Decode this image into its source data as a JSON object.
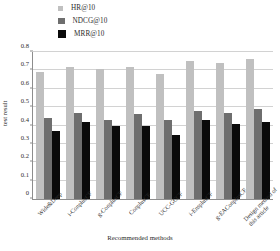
{
  "chart_data": {
    "type": "bar",
    "title": "",
    "xlabel": "Recommended methods",
    "ylabel": "test result",
    "ylim": [
      0,
      0.8
    ],
    "yticks": [
      "0",
      "0.1",
      "0.2",
      "0.3",
      "0.4",
      "0.5",
      "0.6",
      "0.7",
      "0.8"
    ],
    "grid": true,
    "legend_position": "top-center",
    "categories": [
      "Wide&Deep",
      "i-ConplusCF",
      "g-ConplusCF",
      "ConplusCF",
      "UCC-GCCF",
      "i-EnsplusCF",
      "g-EAConplusCF",
      "Design method of this article"
    ],
    "series": [
      {
        "name": "HR@10",
        "color": "#c0c0c0",
        "values": [
          0.69,
          0.72,
          0.71,
          0.72,
          0.68,
          0.75,
          0.74,
          0.76
        ]
      },
      {
        "name": "NDCG@10",
        "color": "#6e6e6e",
        "values": [
          0.44,
          0.47,
          0.43,
          0.46,
          0.43,
          0.48,
          0.47,
          0.49
        ]
      },
      {
        "name": "MRR@10",
        "color": "#0a0a0a",
        "values": [
          0.37,
          0.42,
          0.4,
          0.4,
          0.35,
          0.43,
          0.41,
          0.42
        ]
      }
    ]
  },
  "legend": {
    "items": [
      {
        "label": "HR@10"
      },
      {
        "label": "NDCG@10"
      },
      {
        "label": "MRR@10"
      }
    ]
  },
  "axes": {
    "y_title": "test result",
    "x_title": "Recommended methods"
  }
}
